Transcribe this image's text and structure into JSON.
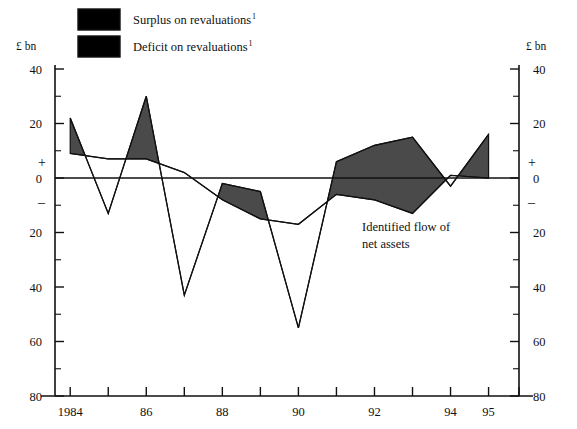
{
  "figure": {
    "unit_label_left": "£ bn",
    "unit_label_right": "£ bn",
    "plus_sign": "+",
    "minus_sign": "–",
    "annotation_line1": "Identified flow of",
    "annotation_line2": "net assets",
    "surplus_color": "#4a4a4a",
    "deficit_color": "#ffffff",
    "axis_color": "#111111"
  },
  "legend": {
    "items": [
      {
        "label": "Surplus on revaluations",
        "footnote": "1",
        "swatch": "#4a4a4a"
      },
      {
        "label": "Deficit on revaluations",
        "footnote": "1",
        "swatch": "#ffffff"
      }
    ]
  },
  "chart_data": {
    "type": "area",
    "title": "",
    "subtitle": "",
    "xlabel": "",
    "ylabel": "£ bn",
    "ylim": [
      -80,
      50
    ],
    "xlim": [
      1983.6,
      1995.8
    ],
    "grid": false,
    "legend_position": "top",
    "y_ticks_major": [
      40,
      20,
      0,
      -20,
      -40,
      -60,
      -80
    ],
    "y_tick_labels": [
      "40",
      "20",
      "0",
      "20",
      "40",
      "60",
      "80"
    ],
    "y_ticks_minor": [
      30,
      10,
      -10,
      -30,
      -50,
      -70
    ],
    "x_ticks": [
      1984,
      1985,
      1986,
      1987,
      1988,
      1989,
      1990,
      1991,
      1992,
      1993,
      1994,
      1995,
      1995.8
    ],
    "x_tick_labels": [
      {
        "x": 1984,
        "label": "1984"
      },
      {
        "x": 1986,
        "label": "86"
      },
      {
        "x": 1988,
        "label": "88"
      },
      {
        "x": 1990,
        "label": "90"
      },
      {
        "x": 1992,
        "label": "92"
      },
      {
        "x": 1994,
        "label": "94"
      },
      {
        "x": 1995,
        "label": "95"
      }
    ],
    "x": [
      1984,
      1985,
      1986,
      1987,
      1988,
      1989,
      1990,
      1991,
      1992,
      1993,
      1994,
      1995
    ],
    "series": [
      {
        "name": "Revaluations",
        "values": [
          22,
          -13,
          30,
          -43,
          -2,
          -5,
          -55,
          6,
          12,
          15,
          -3,
          16
        ]
      },
      {
        "name": "Identified flow of net assets",
        "values": [
          9,
          7,
          7,
          2,
          -8,
          -15,
          -17,
          -6,
          -8,
          -13,
          1,
          0
        ]
      }
    ],
    "fill_between": {
      "upper_series": "Revaluations",
      "lower_series": "Identified flow of net assets",
      "positive_fill": "#4a4a4a",
      "negative_fill": "#ffffff",
      "description": "Area between the revaluations line and the identified flow of net assets line; shaded dark where revaluations exceed the flow (surplus), left white where below (deficit)."
    }
  }
}
